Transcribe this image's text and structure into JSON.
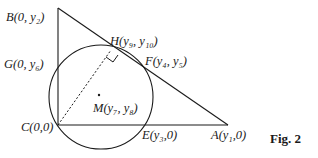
{
  "figure": {
    "caption": "Fig. 2",
    "points": {
      "B": "B(0, y₂)",
      "G": "G(0, y₆)",
      "H": "H(y₉, y₁₀)",
      "F": "F(y₄, y₅)",
      "M": "M(y₇, y₈)",
      "C": "C(0,0)",
      "E": "E(y₃,0)",
      "A": "A(y₁,0)"
    },
    "colors": {
      "stroke": "#1a1a1a",
      "background": "#ffffff"
    }
  }
}
